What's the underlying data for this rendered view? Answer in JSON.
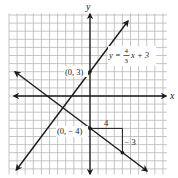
{
  "chart_data": {
    "type": "line",
    "title": "",
    "xlabel": "x",
    "ylabel": "y",
    "xlim": [
      -10,
      9.5
    ],
    "ylim": [
      -9.7,
      10.2
    ],
    "grid": true,
    "grid_step": 1,
    "series": [
      {
        "name": "y = 4/3 x + 3",
        "slope": 1.3333,
        "intercept": 3,
        "x": [
          -9.1,
          4.7
        ],
        "y": [
          -9.13,
          9.27
        ]
      },
      {
        "name": "line through (0,-4) slope -3/4",
        "slope": -0.75,
        "intercept": -4,
        "x": [
          -9.3,
          8.1
        ],
        "y": [
          2.98,
          -10.08
        ]
      }
    ],
    "annotations": [
      {
        "text": "(0, 3)",
        "x": 0,
        "y": 3,
        "marker": true
      },
      {
        "text": "(0, − 4)",
        "x": 0,
        "y": -4,
        "marker": true
      },
      {
        "text": "4",
        "type": "run",
        "from": [
          0,
          -4
        ],
        "to": [
          4,
          -4
        ]
      },
      {
        "text": "− 3",
        "type": "rise",
        "from": [
          4,
          -4
        ],
        "to": [
          4,
          -7
        ]
      },
      {
        "text": "point",
        "x": 4,
        "y": -7,
        "marker": true
      }
    ]
  },
  "labels": {
    "x_axis": "x",
    "y_axis": "y",
    "eq_y": "y =",
    "eq_num": "4",
    "eq_den": "3",
    "eq_rest": "x + 3",
    "point_a": "(0, 3)",
    "point_b": "(0, − 4)",
    "run": "4",
    "rise": "− 3"
  },
  "colors": {
    "grid": "#b8b8b8",
    "axis": "#1a1a1a",
    "line": "#1a1a1a"
  }
}
